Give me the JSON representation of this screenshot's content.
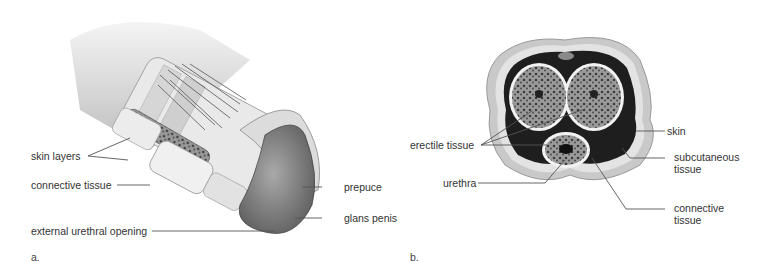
{
  "figure": {
    "panels": [
      {
        "letter": "a.",
        "view": "longitudinal cutaway",
        "labels": {
          "skin_layers": "skin layers",
          "connective_tissue": "connective tissue",
          "external_urethral_opening": "external urethral opening",
          "prepuce": "prepuce",
          "glans_penis": "glans penis"
        }
      },
      {
        "letter": "b.",
        "view": "cross section",
        "labels": {
          "erectile_tissue": "erectile tissue",
          "urethra": "urethra",
          "skin": "skin",
          "subcutaneous_tissue_1": "subcutaneous",
          "subcutaneous_tissue_2": "tissue",
          "connective_tissue_1": "connective",
          "connective_tissue_2": "tissue"
        }
      }
    ],
    "colors": {
      "line": "#555555",
      "tissue_light": "#e6e6e6",
      "tissue_mid": "#bdbdbd",
      "tissue_dark": "#6e6e6e",
      "glans": "#8a8a8a"
    }
  }
}
